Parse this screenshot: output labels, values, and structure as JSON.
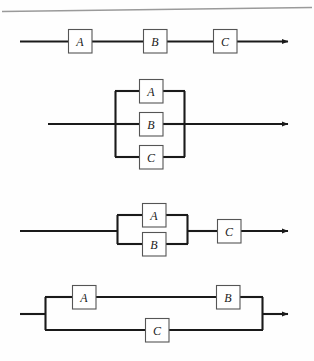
{
  "figure": {
    "background_color": "#fefefe",
    "line_color": "#1a1a1a",
    "box_fill_color": "#ffffff",
    "box_border_color": "#555555",
    "label_color": "#1b1b1b",
    "page_rule_color": "#9a9a9a"
  },
  "diagrams": [
    {
      "id": "diagram-1",
      "name": "series-a-b-c",
      "caption": "A, B and C in series",
      "blocks": [
        {
          "label": "A",
          "name": "block-a"
        },
        {
          "label": "B",
          "name": "block-b"
        },
        {
          "label": "C",
          "name": "block-c"
        }
      ]
    },
    {
      "id": "diagram-2",
      "name": "parallel-a-b-c",
      "caption": "A, B and C in parallel",
      "blocks": [
        {
          "label": "A",
          "name": "block-a"
        },
        {
          "label": "B",
          "name": "block-b"
        },
        {
          "label": "C",
          "name": "block-c"
        }
      ]
    },
    {
      "id": "diagram-3",
      "name": "parallel-a-b-series-c",
      "caption": "A parallel B, in series with C",
      "blocks": [
        {
          "label": "A",
          "name": "block-a"
        },
        {
          "label": "B",
          "name": "block-b"
        },
        {
          "label": "C",
          "name": "block-c"
        }
      ]
    },
    {
      "id": "diagram-4",
      "name": "series-a-b-parallel-c",
      "caption": "A in series with B, in parallel with C",
      "blocks": [
        {
          "label": "A",
          "name": "block-a"
        },
        {
          "label": "B",
          "name": "block-b"
        },
        {
          "label": "C",
          "name": "block-c"
        }
      ]
    }
  ]
}
